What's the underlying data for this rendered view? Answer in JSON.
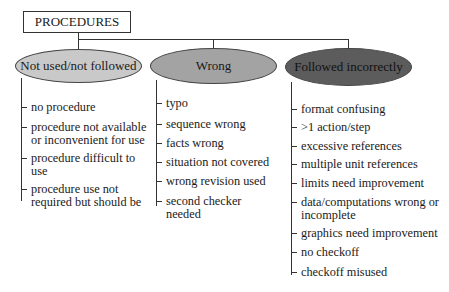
{
  "root": {
    "label": "PROCEDURES"
  },
  "categories": [
    {
      "label": "Not used/not followed",
      "fill": "#c9c9c9",
      "items": [
        "no procedure",
        "procedure not available or inconvenient for use",
        "procedure difficult to use",
        "procedure use not required but should be"
      ],
      "items_lines": [
        [
          "no procedure"
        ],
        [
          "procedure not available",
          "or inconvenient for use"
        ],
        [
          "procedure difficult to",
          "use"
        ],
        [
          "procedure use not",
          "required but should be"
        ]
      ]
    },
    {
      "label": "Wrong",
      "fill": "#a3a3a3",
      "items": [
        "typo",
        "sequence wrong",
        "facts wrong",
        "situation not covered",
        "wrong revision used",
        "second checker needed"
      ],
      "items_lines": [
        [
          "typo"
        ],
        [
          "sequence wrong"
        ],
        [
          "facts wrong"
        ],
        [
          "situation not covered"
        ],
        [
          "wrong revision used"
        ],
        [
          "second checker",
          "needed"
        ]
      ]
    },
    {
      "label": "Followed incorrectly",
      "fill": "#5c5c5c",
      "items": [
        "format confusing",
        ">1 action/step",
        "excessive references",
        "multiple unit references",
        "limits need improvement",
        "data/computations wrong or incomplete",
        "graphics need improvement",
        "no checkoff",
        "checkoff misused"
      ],
      "items_lines": [
        [
          "format confusing"
        ],
        [
          ">1 action/step"
        ],
        [
          "excessive references"
        ],
        [
          "multiple unit references"
        ],
        [
          "limits need improvement"
        ],
        [
          "data/computations wrong or",
          "incomplete"
        ],
        [
          "graphics need improvement"
        ],
        [
          "no checkoff"
        ],
        [
          "checkoff misused"
        ]
      ]
    }
  ]
}
